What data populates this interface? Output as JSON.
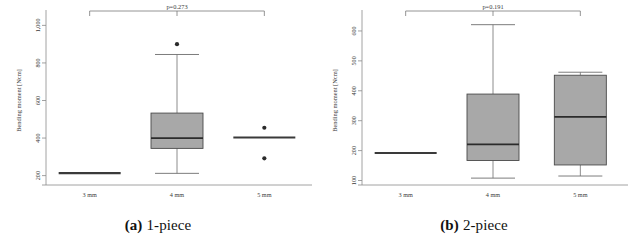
{
  "figure": {
    "panels": [
      {
        "caption_tag": "(a)",
        "caption_text": "1-piece",
        "chart_data": {
          "type": "box",
          "title": "",
          "xlabel": "",
          "ylabel": "Bending moment [Ncm]",
          "categories": [
            "3 mm",
            "4 mm",
            "5 mm"
          ],
          "ylim": [
            150,
            1050
          ],
          "yticks": [
            200,
            400,
            600,
            800,
            1000
          ],
          "ytick_labels": [
            "200",
            "400",
            "600",
            "800",
            "1,000"
          ],
          "grid": false,
          "legend": "none",
          "annotations": [
            {
              "label": "p=0.273",
              "from": "3 mm",
              "to": "5 mm"
            }
          ],
          "boxes": [
            {
              "category": "3 mm",
              "degenerate": true,
              "value": 213,
              "q1": 213,
              "median": 213,
              "q3": 213,
              "whisker_low": 213,
              "whisker_high": 213,
              "outliers": []
            },
            {
              "category": "4 mm",
              "degenerate": false,
              "q1": 345,
              "median": 400,
              "q3": 533,
              "whisker_low": 212,
              "whisker_high": 845,
              "outliers": [
                900
              ]
            },
            {
              "category": "5 mm",
              "degenerate": true,
              "value": 403,
              "q1": 403,
              "median": 403,
              "q3": 403,
              "whisker_low": 403,
              "whisker_high": 403,
              "outliers": [
                455,
                292
              ]
            }
          ]
        }
      },
      {
        "caption_tag": "(b)",
        "caption_text": "2-piece",
        "chart_data": {
          "type": "box",
          "title": "",
          "xlabel": "",
          "ylabel": "Bending moment [Ncm]",
          "categories": [
            "3 mm",
            "4 mm",
            "5 mm"
          ],
          "ylim": [
            85,
            650
          ],
          "yticks": [
            100,
            200,
            300,
            400,
            500,
            600
          ],
          "ytick_labels": [
            "100",
            "200",
            "300",
            "400",
            "500",
            "600"
          ],
          "grid": false,
          "legend": "none",
          "annotations": [
            {
              "label": "p=0.191",
              "from": "3 mm",
              "to": "5 mm"
            }
          ],
          "boxes": [
            {
              "category": "3 mm",
              "degenerate": true,
              "value": 192,
              "q1": 192,
              "median": 192,
              "q3": 192,
              "whisker_low": 192,
              "whisker_high": 192,
              "outliers": []
            },
            {
              "category": "4 mm",
              "degenerate": false,
              "q1": 167,
              "median": 221,
              "q3": 389,
              "whisker_low": 108,
              "whisker_high": 621,
              "outliers": []
            },
            {
              "category": "5 mm",
              "degenerate": false,
              "q1": 152,
              "median": 313,
              "q3": 452,
              "whisker_low": 115,
              "whisker_high": 462,
              "outliers": []
            }
          ]
        }
      }
    ]
  }
}
